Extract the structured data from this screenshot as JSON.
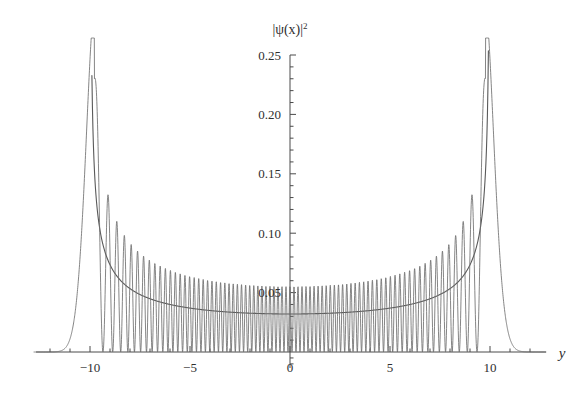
{
  "figure": {
    "name": "quantum-harmonic-oscillator-probability-density",
    "background_color": "#ffffff",
    "curve_color": "#6a6a6a",
    "envelope_color": "#595959",
    "axis_color": "#4a4a4a",
    "text_color": "#2f2f2f"
  },
  "axes": {
    "y_axis_label_main": "|ψ(x)|",
    "y_axis_label_exponent": "2",
    "x_axis_label": "y",
    "x_ticks": [
      "-10",
      "-5",
      "0",
      "5",
      "10"
    ],
    "x_tick_values": [
      -10,
      -5,
      0,
      5,
      10
    ],
    "y_ticks": [
      "0.05",
      "0.10",
      "0.15",
      "0.20",
      "0.25"
    ],
    "y_tick_values": [
      0.05,
      0.1,
      0.15,
      0.2,
      0.25
    ],
    "x_minor_tick_step": 1,
    "y_minor_tick_step": 0.01,
    "xlim": [
      -12.8,
      12.8
    ],
    "ylim": [
      0,
      0.25
    ],
    "grid": false
  },
  "chart_data": {
    "type": "line",
    "title": "",
    "subtitle": "",
    "xlabel": "y",
    "ylabel": "|ψ(x)|^2",
    "xlim": [
      -12.8,
      12.8
    ],
    "ylim": [
      0,
      0.25
    ],
    "grid": false,
    "legend_position": "none",
    "x_tick_labels": [
      "-10",
      "-5",
      "0",
      "5",
      "10"
    ],
    "y_tick_labels": [
      "0.05",
      "0.10",
      "0.15",
      "0.20",
      "0.25"
    ],
    "annotations": [],
    "series": [
      {
        "name": "quantum probability density",
        "type": "line",
        "description": "Rapidly oscillating |psi_n(y)|^2 for a high-n harmonic oscillator eigenstate; oscillation peaks grow from about 0.055 at the centre to beyond 0.25 at the classical turning points near y = -10 and y = +10, then decay exponentially to zero outside.",
        "quantum_number_n": 49,
        "turning_points": [
          -10,
          10
        ],
        "center_peak_value": 0.055,
        "center_envelope_value": 0.032,
        "peak_near_turning_point_value": 0.215,
        "max_peak_value": 0.29,
        "oscillation_peaks_per_unit_at_center": 5
      },
      {
        "name": "classical probability density",
        "type": "line",
        "description": "Smooth classical envelope 1/(pi*sqrt(a^2 - y^2)) with a = 10, minimum at the centre and diverging at the turning points.",
        "amplitude_a": 10,
        "center_value": 0.032,
        "values_at_x": [
          {
            "x": 0,
            "y": 0.0318
          },
          {
            "x": 2,
            "y": 0.0325
          },
          {
            "x": 4,
            "y": 0.0347
          },
          {
            "x": 6,
            "y": 0.0398
          },
          {
            "x": 8,
            "y": 0.0531
          },
          {
            "x": 9,
            "y": 0.073
          },
          {
            "x": 9.5,
            "y": 0.102
          },
          {
            "x": 9.8,
            "y": 0.161
          }
        ]
      }
    ]
  }
}
